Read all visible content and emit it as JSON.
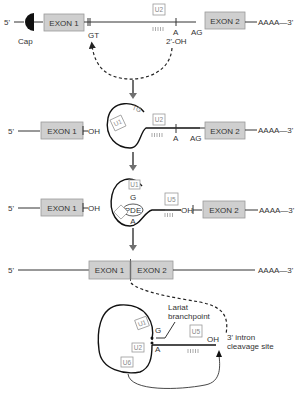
{
  "diagram": {
    "type": "mRNA splicing mechanism",
    "steps": [
      {
        "id": 1,
        "labels": {
          "five_prime": "5'",
          "cap": "Cap",
          "exon1": "EXON 1",
          "gt": "GT",
          "u2": "U2",
          "a": "A",
          "oh": "2'-OH",
          "ag": "AG",
          "exon2": "EXON 2",
          "polyA": "AAAA—3'"
        }
      },
      {
        "id": 2,
        "labels": {
          "five_prime": "5'",
          "exon1": "EXON 1",
          "oh": "OH",
          "u1": "U1",
          "tg": "TG",
          "u2": "U2",
          "a": "A",
          "ag": "AG",
          "exon2": "EXON 2",
          "polyA": "AAAA—3'"
        }
      },
      {
        "id": 3,
        "labels": {
          "five_prime": "5'",
          "exon1": "EXON 1",
          "oh": "OH",
          "u1": "U1",
          "g": "G",
          "pde": "PDE",
          "a": "A",
          "u2": "U2",
          "u5": "U5",
          "oh2": "OH",
          "exon2": "EXON 2",
          "polyA": "AAAA—3'"
        }
      },
      {
        "id": 4,
        "labels": {
          "five_prime": "5'",
          "exon1": "EXON 1",
          "exon2": "EXON 2",
          "polyA": "AAAA—3'"
        }
      },
      {
        "id": 5,
        "labels": {
          "lariat": "Lariat",
          "branchpoint": "branchpoint",
          "g": "G",
          "a": "A",
          "u1": "U1",
          "u2": "U2",
          "u6": "U6",
          "u5": "U5",
          "oh": "OH",
          "cleavage1": "3' intron",
          "cleavage2": "cleavage site"
        }
      }
    ]
  }
}
